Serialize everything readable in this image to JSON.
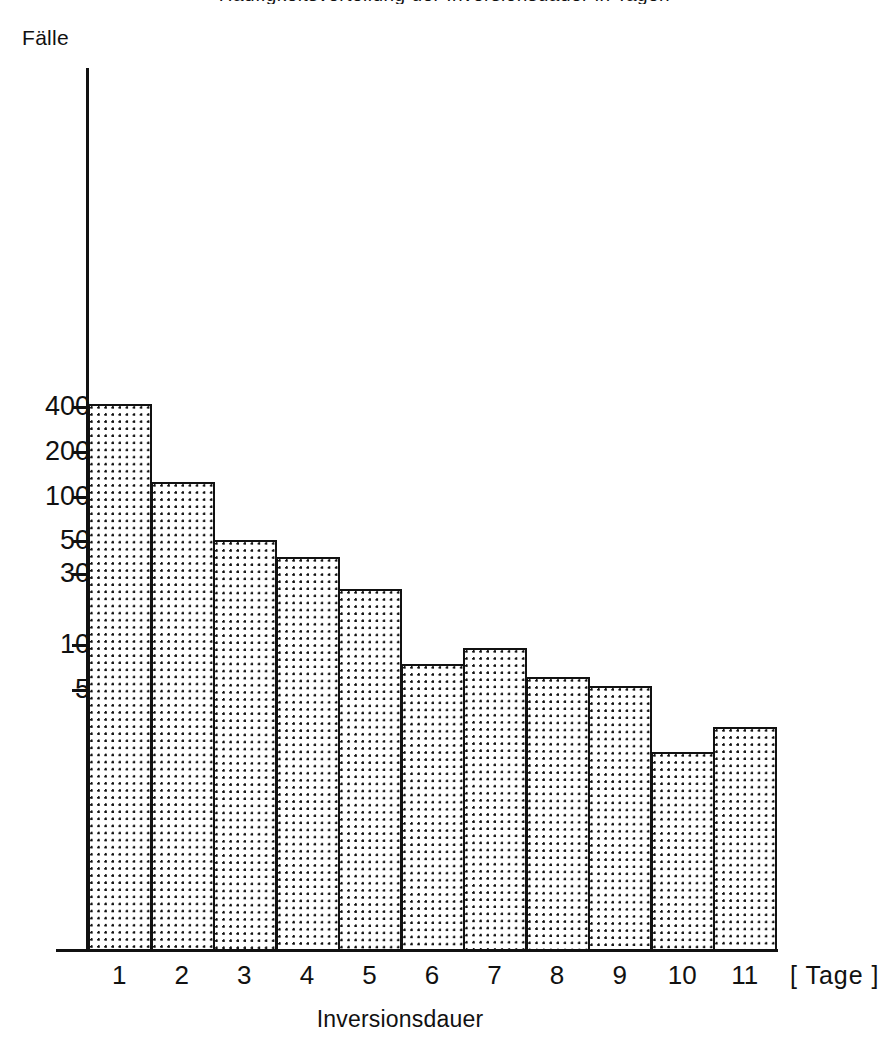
{
  "figure": {
    "title_clipped": "Häufigkeitsverteilung der Inversionsdauer in Tagen",
    "y_axis_title": "Fälle",
    "x_axis_title": "Inversionsdauer",
    "x_axis_unit": "[ Tage ]"
  },
  "chart_data": {
    "type": "bar",
    "title": "Häufigkeitsverteilung der Inversionsdauer in Tagen",
    "xlabel": "Inversionsdauer",
    "xunit": "[ Tage ]",
    "ylabel": "Fälle",
    "yscale": "log",
    "ylim": [
      1,
      500
    ],
    "xlim": [
      0.5,
      11.5
    ],
    "grid": false,
    "legend": null,
    "categories": [
      "1",
      "2",
      "3",
      "4",
      "5",
      "6",
      "7",
      "8",
      "9",
      "10",
      "11"
    ],
    "values": [
      420,
      125,
      51,
      39,
      24,
      7.4,
      9.5,
      6.1,
      5.3,
      1.9,
      2.8
    ],
    "ytick_labels": [
      "400",
      "200",
      "100",
      "50",
      "30",
      "10",
      "5"
    ],
    "ytick_values": [
      400,
      200,
      100,
      50,
      30,
      10,
      5
    ],
    "bar_fill": "dotted-stipple",
    "bar_edge_color": "#111111",
    "bar_face_color": "#ffffff"
  },
  "geometry": {
    "plot_left": 88,
    "plot_right": 776,
    "baseline_y": 950,
    "top_y": 68,
    "log_ref_value": 10,
    "log_ref_y": 645,
    "px_per_decade": 148.3
  }
}
